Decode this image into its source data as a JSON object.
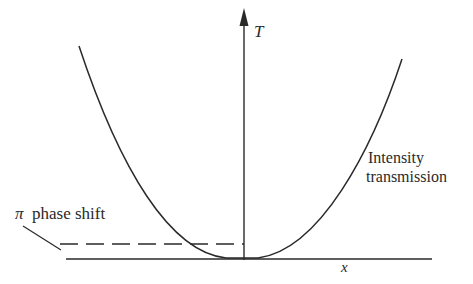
{
  "diagram": {
    "axes": {
      "vertical_label": "T",
      "horizontal_label": "x"
    },
    "curve_label": {
      "line1": "Intensity",
      "line2": "transmission"
    },
    "annotation": {
      "symbol": "π",
      "text": "phase shift"
    },
    "colors": {
      "ink": "#2a2a2a",
      "background": "#ffffff"
    }
  }
}
